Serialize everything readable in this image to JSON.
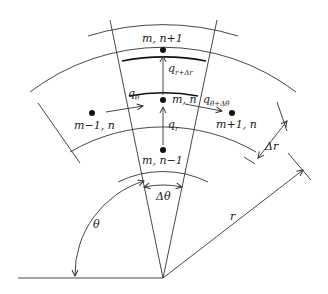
{
  "diagram": {
    "type": "polar finite-difference grid cell",
    "colors": {
      "line": "#333333",
      "bold_line": "#111111",
      "background": "#ffffff"
    },
    "nodes": [
      {
        "id": "center",
        "label": "m, n"
      },
      {
        "id": "outer",
        "label": "m, n+1"
      },
      {
        "id": "inner",
        "label": "m, n−1"
      },
      {
        "id": "left",
        "label": "m−1, n"
      },
      {
        "id": "right",
        "label": "m+1, n"
      }
    ],
    "fluxes": {
      "q_theta": {
        "base": "q",
        "sub": "θ"
      },
      "q_theta_dtheta": {
        "base": "q",
        "sub": "θ+Δθ"
      },
      "q_r": {
        "base": "q",
        "sub": "r"
      },
      "q_r_dr": {
        "base": "q",
        "sub": "r+Δr"
      }
    },
    "dimensions": {
      "delta_r": "Δr",
      "delta_theta": "Δθ",
      "theta": "θ",
      "r": "r"
    }
  }
}
